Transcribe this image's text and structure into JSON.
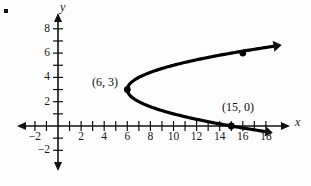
{
  "figure": {
    "bullet_marker": "▪",
    "background_color": "#fdfdfd",
    "ink_color": "#000000"
  },
  "axes": {
    "x_name": "x",
    "y_name": "y",
    "x_ticks": [
      {
        "value": -2,
        "label": "−2"
      },
      {
        "value": -1,
        "label": ""
      },
      {
        "value": 1,
        "label": ""
      },
      {
        "value": 2,
        "label": "2"
      },
      {
        "value": 3,
        "label": ""
      },
      {
        "value": 4,
        "label": "4"
      },
      {
        "value": 5,
        "label": ""
      },
      {
        "value": 6,
        "label": "6"
      },
      {
        "value": 7,
        "label": ""
      },
      {
        "value": 8,
        "label": "8"
      },
      {
        "value": 9,
        "label": ""
      },
      {
        "value": 10,
        "label": "10"
      },
      {
        "value": 11,
        "label": ""
      },
      {
        "value": 12,
        "label": "12"
      },
      {
        "value": 13,
        "label": ""
      },
      {
        "value": 14,
        "label": "14"
      },
      {
        "value": 15,
        "label": ""
      },
      {
        "value": 16,
        "label": "16"
      },
      {
        "value": 17,
        "label": ""
      },
      {
        "value": 18,
        "label": "18"
      }
    ],
    "y_ticks": [
      {
        "value": 8,
        "label": "8"
      },
      {
        "value": 7,
        "label": ""
      },
      {
        "value": 6,
        "label": "6"
      },
      {
        "value": 5,
        "label": ""
      },
      {
        "value": 4,
        "label": "4"
      },
      {
        "value": 3,
        "label": ""
      },
      {
        "value": 2,
        "label": "2"
      },
      {
        "value": 1,
        "label": ""
      },
      {
        "value": -1,
        "label": ""
      },
      {
        "value": -2,
        "label": "−2"
      }
    ]
  },
  "annotations": [
    {
      "id": "vertex-label",
      "text": "(6, 3)",
      "x": 6,
      "y": 3
    },
    {
      "id": "x-intercept-label",
      "text": "(15, 0)",
      "x": 15,
      "y": 0
    }
  ],
  "chart_data": {
    "type": "line",
    "title": "",
    "xlabel": "x",
    "ylabel": "y",
    "xlim": [
      -3,
      19
    ],
    "ylim": [
      -3,
      9
    ],
    "grid": false,
    "legend": null,
    "curve_description": "Horizontal parabola opening to the right with vertex at (6, 3); x = 6 + (y - 3)^2",
    "series": [
      {
        "name": "parabola",
        "equation": "x = 6 + (y - 3)^2",
        "vertex": [
          6,
          3
        ],
        "opens": "right",
        "y_range": [
          -0.4,
          6.6
        ],
        "points": [
          [
            15.0,
            0.0
          ],
          [
            13.0,
            0.84
          ],
          [
            11.0,
            0.76
          ],
          [
            9.0,
            1.27
          ],
          [
            7.5,
            1.78
          ],
          [
            6.6,
            2.23
          ],
          [
            6.0,
            3.0
          ],
          [
            6.6,
            3.77
          ],
          [
            7.5,
            4.22
          ],
          [
            9.0,
            4.73
          ],
          [
            11.0,
            5.24
          ],
          [
            13.0,
            5.66
          ],
          [
            15.0,
            6.0
          ],
          [
            16.2,
            6.2
          ]
        ],
        "arrows": [
          "upper-right-end",
          "lower-right-end"
        ]
      }
    ],
    "marked_points": [
      {
        "label": "(6, 3)",
        "x": 6,
        "y": 3
      },
      {
        "label": "(15, 0)",
        "x": 15,
        "y": 0
      },
      {
        "label": "",
        "x": 16,
        "y": 6
      }
    ]
  }
}
